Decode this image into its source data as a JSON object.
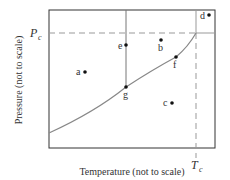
{
  "diagram": {
    "type": "phase-diagram",
    "title": "",
    "xlabel": "Temperature (not to scale)",
    "ylabel": "Pressure (not to scale)",
    "critical_pressure_label": "P",
    "critical_pressure_sub": "c",
    "critical_temperature_label": "T",
    "critical_temperature_sub": "c",
    "points": [
      {
        "label": "a",
        "x": 85,
        "y": 72
      },
      {
        "label": "b",
        "x": 161,
        "y": 40
      },
      {
        "label": "c",
        "x": 172,
        "y": 103
      },
      {
        "label": "d",
        "x": 209,
        "y": 15
      },
      {
        "label": "e",
        "x": 126,
        "y": 45
      },
      {
        "label": "f",
        "x": 176,
        "y": 57
      },
      {
        "label": "g",
        "x": 126,
        "y": 87
      }
    ],
    "colors": {
      "frame": "#333333",
      "curve": "#888888",
      "dash": "#999999",
      "point": "#111111"
    }
  }
}
